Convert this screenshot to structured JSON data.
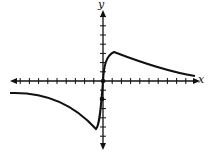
{
  "chart_data": {
    "type": "line",
    "title": "",
    "xlabel": "x",
    "ylabel": "y",
    "xlim": [
      -10,
      10
    ],
    "ylim": [
      -6,
      8
    ],
    "grid": false,
    "tick_spacing": 1,
    "points": [
      {
        "x": 0,
        "y": 0,
        "marked": true
      },
      {
        "x": 0,
        "y": -2,
        "marked": true
      }
    ],
    "series": [
      {
        "name": "f(x)",
        "x": [
          -10,
          -8,
          -6,
          -4,
          -2,
          -1,
          -0.8,
          -0.4,
          0,
          0.3,
          0.6,
          1.2,
          2,
          4,
          6,
          8,
          9.5
        ],
        "y": [
          -1.3,
          -1.4,
          -1.8,
          -2.5,
          -3.8,
          -4.8,
          -5.2,
          -3,
          0,
          2,
          2.9,
          3.2,
          2.9,
          2.1,
          1.4,
          0.9,
          0.6
        ]
      }
    ]
  }
}
